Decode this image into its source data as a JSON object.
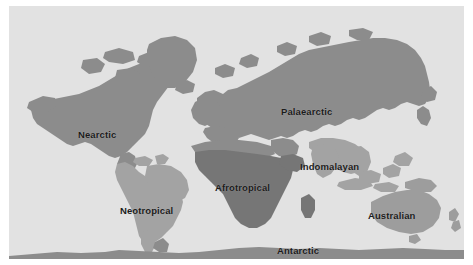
{
  "map": {
    "title": "World map of biogeographic realms",
    "projection": "Robinson",
    "ocean_color": "#e2e2e2",
    "frame": {
      "x": 9,
      "y": 6,
      "width": 455,
      "height": 253
    },
    "label_color": "#1b1b1b",
    "realms": [
      {
        "id": "nearctic",
        "label": "Nearctic",
        "color": "#8c8c8c",
        "label_x": 78,
        "label_y": 130
      },
      {
        "id": "neotropical",
        "label": "Neotropical",
        "color": "#a3a3a3",
        "label_x": 120,
        "label_y": 206
      },
      {
        "id": "palaearctic",
        "label": "Palaearctic",
        "color": "#8c8c8c",
        "label_x": 281,
        "label_y": 107
      },
      {
        "id": "afrotropical",
        "label": "Afrotropical",
        "color": "#767676",
        "label_x": 215,
        "label_y": 183
      },
      {
        "id": "indomalayan",
        "label": "Indomalayan",
        "color": "#a3a3a3",
        "label_x": 300,
        "label_y": 162
      },
      {
        "id": "australian",
        "label": "Australian",
        "color": "#9d9d9d",
        "label_x": 368,
        "label_y": 211
      },
      {
        "id": "antarctic",
        "label": "Antarctic",
        "color": "#8c8c8c",
        "label_x": 277,
        "label_y": 246
      }
    ]
  }
}
